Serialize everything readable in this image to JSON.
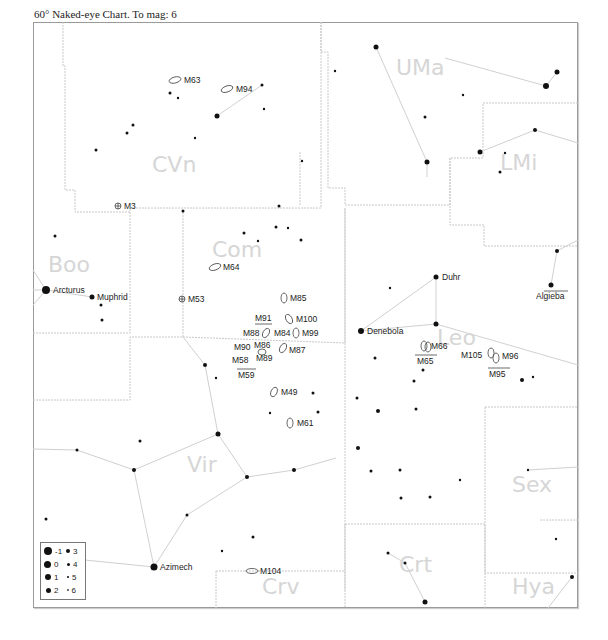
{
  "header": {
    "title": "60° Naked-eye Chart. To mag: 6"
  },
  "constellations": [
    {
      "abbr": "CVn",
      "x": 152,
      "y": 172
    },
    {
      "abbr": "UMa",
      "x": 397,
      "y": 72
    },
    {
      "abbr": "LMi",
      "x": 501,
      "y": 166
    },
    {
      "abbr": "Boo",
      "x": 48,
      "y": 270
    },
    {
      "abbr": "Com",
      "x": 212,
      "y": 255
    },
    {
      "abbr": "Leo",
      "x": 437,
      "y": 343
    },
    {
      "abbr": "Vir",
      "x": 187,
      "y": 470
    },
    {
      "abbr": "Sex",
      "x": 512,
      "y": 492
    },
    {
      "abbr": "Crv",
      "x": 262,
      "y": 592
    },
    {
      "abbr": "Crt",
      "x": 400,
      "y": 572
    },
    {
      "abbr": "Hya",
      "x": 512,
      "y": 592
    }
  ],
  "named_stars": [
    {
      "name": "Arcturus",
      "x": 46,
      "y": 290
    },
    {
      "name": "Muphrid",
      "x": 92,
      "y": 297
    },
    {
      "name": "Denebola",
      "x": 361,
      "y": 331
    },
    {
      "name": "Duhr",
      "x": 436,
      "y": 277
    },
    {
      "name": "Algieba",
      "x": 551,
      "y": 285
    },
    {
      "name": "Azimech",
      "x": 154,
      "y": 567
    }
  ],
  "messier_objects": [
    {
      "id": "M63",
      "x": 176,
      "y": 80,
      "shape": "galaxy"
    },
    {
      "id": "M94",
      "x": 229,
      "y": 89,
      "shape": "galaxy"
    },
    {
      "id": "M3",
      "x": 118,
      "y": 206,
      "shape": "globular"
    },
    {
      "id": "M64",
      "x": 216,
      "y": 267,
      "shape": "galaxy"
    },
    {
      "id": "M53",
      "x": 182,
      "y": 299,
      "shape": "globular"
    },
    {
      "id": "M85",
      "x": 284,
      "y": 298,
      "shape": "galaxy"
    },
    {
      "id": "M91",
      "x": 262,
      "y": 319,
      "shape": "label"
    },
    {
      "id": "M100",
      "x": 290,
      "y": 319,
      "shape": "galaxy"
    },
    {
      "id": "M88",
      "x": 265,
      "y": 333,
      "shape": "galaxy"
    },
    {
      "id": "M84",
      "x": 278,
      "y": 333,
      "shape": "label"
    },
    {
      "id": "M99",
      "x": 296,
      "y": 333,
      "shape": "galaxy"
    },
    {
      "id": "M90",
      "x": 254,
      "y": 348,
      "shape": "label"
    },
    {
      "id": "M86",
      "x": 262,
      "y": 346,
      "shape": "label"
    },
    {
      "id": "M87",
      "x": 283,
      "y": 350,
      "shape": "galaxy"
    },
    {
      "id": "M58",
      "x": 249,
      "y": 361,
      "shape": "label"
    },
    {
      "id": "M89",
      "x": 266,
      "y": 358,
      "shape": "label"
    },
    {
      "id": "M59",
      "x": 246,
      "y": 375,
      "shape": "label"
    },
    {
      "id": "M49",
      "x": 275,
      "y": 392,
      "shape": "galaxy"
    },
    {
      "id": "M61",
      "x": 290,
      "y": 423,
      "shape": "galaxy"
    },
    {
      "id": "M66",
      "x": 424,
      "y": 346,
      "shape": "galaxy"
    },
    {
      "id": "M65",
      "x": 426,
      "y": 360,
      "shape": "label"
    },
    {
      "id": "M105",
      "x": 473,
      "y": 354,
      "shape": "label"
    },
    {
      "id": "M96",
      "x": 498,
      "y": 356,
      "shape": "galaxy"
    },
    {
      "id": "M95",
      "x": 499,
      "y": 373,
      "shape": "label"
    },
    {
      "id": "M104",
      "x": 253,
      "y": 571,
      "shape": "galaxy"
    }
  ],
  "legend": {
    "title": "magnitudes",
    "items": [
      {
        "mag": "-1",
        "size": 8
      },
      {
        "mag": "0",
        "size": 7
      },
      {
        "mag": "1",
        "size": 6
      },
      {
        "mag": "2",
        "size": 5
      },
      {
        "mag": "3",
        "size": 4
      },
      {
        "mag": "4",
        "size": 3
      },
      {
        "mag": "5",
        "size": 2
      },
      {
        "mag": "6",
        "size": 1.5
      }
    ]
  },
  "colors": {
    "boundary": "#c8c8c8",
    "figure": "#d0d0d0",
    "constellation_label": "#d6d6d6",
    "star": "#111111"
  }
}
